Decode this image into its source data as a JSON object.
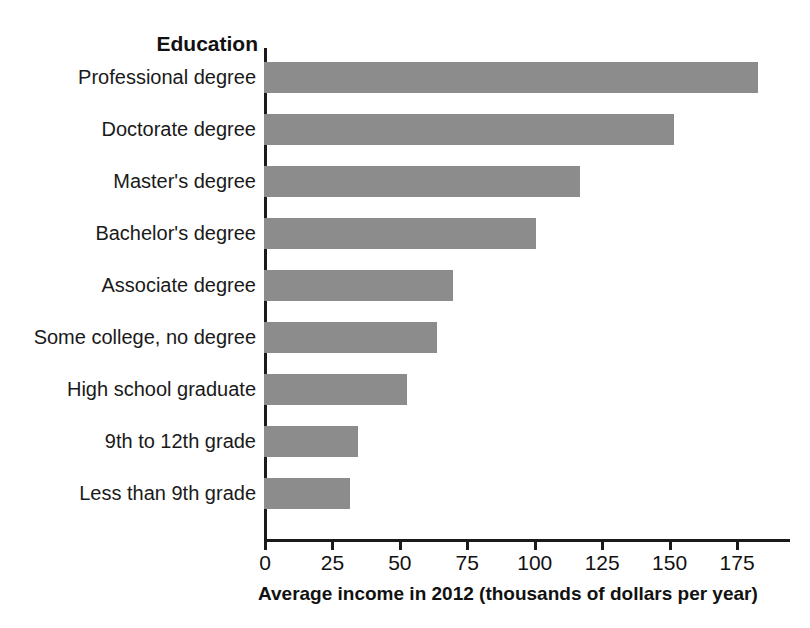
{
  "chart_data": {
    "type": "bar",
    "orientation": "horizontal",
    "title": "",
    "category_axis_title": "Education",
    "xlabel": "Average income in 2012 (thousands of dollars per year)",
    "ylabel": "Education",
    "categories": [
      "Professional degree",
      "Doctorate degree",
      "Master's degree",
      "Bachelor's degree",
      "Associate degree",
      "Some college, no degree",
      "High school graduate",
      "9th to 12th grade",
      "Less than 9th grade"
    ],
    "values": [
      183,
      152,
      117,
      101,
      70,
      64,
      53,
      35,
      32
    ],
    "xlim": [
      0,
      195
    ],
    "xticks": [
      0,
      25,
      50,
      75,
      100,
      125,
      150,
      175
    ],
    "xtick_labels": [
      "0",
      "25",
      "50",
      "75",
      "100",
      "125",
      "150",
      "175"
    ],
    "grid": false,
    "legend": "none",
    "bar_color": "#8c8c8c",
    "axis_color": "#1a1a1a",
    "background": "#ffffff"
  }
}
